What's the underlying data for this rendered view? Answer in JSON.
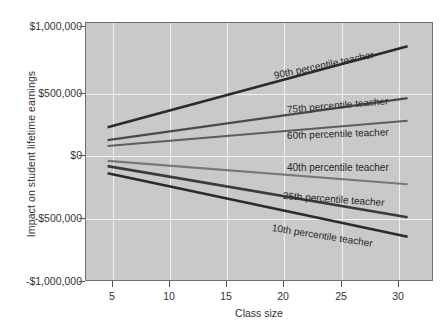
{
  "chart_data": {
    "type": "line",
    "title": "",
    "xlabel": "Class size",
    "ylabel": "Impact on student lifetime earnings",
    "xlim": [
      3.2,
      32.2
    ],
    "ylim": [
      -1000000,
      1000000
    ],
    "x_ticks": [
      5,
      10,
      15,
      20,
      25,
      30
    ],
    "x_tick_labels": [
      "5",
      "10",
      "15",
      "20",
      "25",
      "30"
    ],
    "y_ticks": [
      1000000,
      500000,
      0,
      -500000,
      -1000000
    ],
    "y_tick_labels": [
      "$1,000,000",
      "$500,000",
      "$0",
      "-$500,000",
      "-$1,000,000"
    ],
    "grid": true,
    "grid_color": "#f2f2f2",
    "plot_background": "#c9c9c9",
    "legend": "inline-annotations",
    "x": [
      5,
      30
    ],
    "series": [
      {
        "name": "90th percentile teacher",
        "label": "90th percentile teacher",
        "values": [
          195000,
          820000
        ],
        "color": "#2b2b2b",
        "width": 2.6
      },
      {
        "name": "75th percentile teacher",
        "label": "75th percentile teacher",
        "values": [
          95000,
          420000
        ],
        "color": "#4a4a4a",
        "width": 2.2
      },
      {
        "name": "60th percentile teacher",
        "label": "60th percentile teacher",
        "values": [
          50000,
          245000
        ],
        "color": "#5e5e5e",
        "width": 2.2
      },
      {
        "name": "40th percentile teacher",
        "label": "40th percentile teacher",
        "values": [
          -65000,
          -245000
        ],
        "color": "#777777",
        "width": 2.2
      },
      {
        "name": "25th percentile teacher",
        "label": "25th percentile teacher",
        "values": [
          -105000,
          -500000
        ],
        "color": "#3a3a3a",
        "width": 2.6
      },
      {
        "name": "10th percentile teacher",
        "label": "10th percentile teacher",
        "values": [
          -160000,
          -650000
        ],
        "color": "#2b2b2b",
        "width": 2.6
      }
    ]
  },
  "axes": {
    "y_title": "Impact on student lifetime earnings",
    "x_title": "Class size",
    "y_labels": {
      "t0": "$1,000,000",
      "t1": "$500,000",
      "t2": "$0",
      "t3": "-$500,000",
      "t4": "-$1,000,000"
    },
    "x_labels": {
      "t0": "5",
      "t1": "10",
      "t2": "15",
      "t3": "20",
      "t4": "25",
      "t5": "30"
    }
  },
  "annotations": {
    "s90": "90th percentile teacher",
    "s75": "75th percentile teacher",
    "s60": "60th percentile teacher",
    "s40": "40th percentile teacher",
    "s25": "25th percentile teacher",
    "s10": "10th percentile teacher"
  }
}
